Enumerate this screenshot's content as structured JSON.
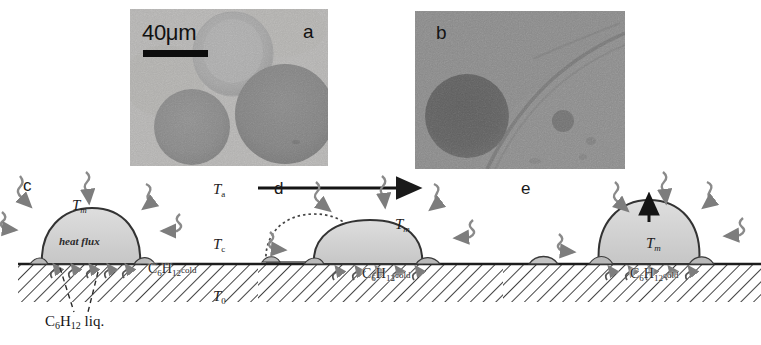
{
  "figure": {
    "width": 761,
    "height": 345,
    "background": "#ffffff"
  },
  "panels": {
    "a": {
      "letter": "a",
      "type": "micrograph",
      "scalebar_label": "40μm",
      "scalebar_length_um": 40,
      "description": "optical micrograph of three droplets"
    },
    "b": {
      "letter": "b",
      "type": "micrograph",
      "description": "optical micrograph of a dark droplet beside a diagonal ridge"
    },
    "c": {
      "letter": "c",
      "type": "diagram",
      "drop_temp": "T",
      "drop_temp_sub": "m",
      "heat_flux_label": "heat flux",
      "substrate_formula": "C",
      "substrate_sub1": "6",
      "substrate_elem2": "H",
      "substrate_sub2": "12",
      "substrate_state": "cold",
      "ambient_temp": "T",
      "ambient_temp_sub": "a",
      "contact_temp": "T",
      "contact_temp_sub": "c",
      "base_temp": "T",
      "base_temp_sub": "0",
      "liquid_label": "C",
      "liquid_sub1": "6",
      "liquid_elem2": "H",
      "liquid_sub2": "12",
      "liquid_state": " liq."
    },
    "d": {
      "letter": "d",
      "type": "diagram",
      "drop_temp": "T",
      "drop_temp_sub": "m",
      "substrate_formula": "C",
      "substrate_sub1": "6",
      "substrate_elem2": "H",
      "substrate_sub2": "12",
      "substrate_state": "cold",
      "motion": "horizontal self-propelled motion to the right",
      "ghost": "dotted outline of former droplet position"
    },
    "e": {
      "letter": "e",
      "type": "diagram",
      "drop_temp": "T",
      "drop_temp_sub": "m",
      "substrate_formula": "C",
      "substrate_sub1": "6",
      "substrate_elem2": "H",
      "substrate_sub2": "12",
      "substrate_state": "cold",
      "motion": "vertical upward arrow at droplet apex"
    }
  },
  "colors": {
    "droplet_fill": "#cfcfcf",
    "droplet_stroke": "#2b2b2b",
    "hatch_line": "#333333",
    "arrow": "#6e6e6e",
    "text": "#1a1a1a",
    "scalebar": "#0d0d0d"
  }
}
